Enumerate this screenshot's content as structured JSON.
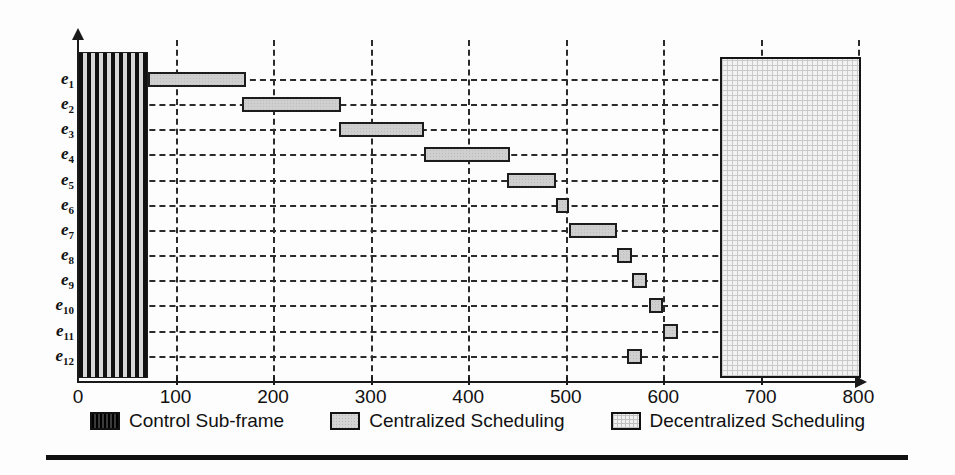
{
  "chart_data": {
    "type": "bar",
    "title": "",
    "subtitle": "",
    "xlabel": "",
    "ylabel": "",
    "orientation": "horizontal",
    "grid": "dashed-both-axes",
    "legend_position": "bottom-center",
    "xlim": [
      0,
      800
    ],
    "xticks": [
      0,
      100,
      200,
      300,
      400,
      500,
      600,
      700,
      800
    ],
    "xtick_labels": [
      "0",
      "100",
      "200",
      "300",
      "400",
      "500",
      "600",
      "700",
      "800"
    ],
    "categories": [
      "e1",
      "e2",
      "e3",
      "e4",
      "e5",
      "e6",
      "e7",
      "e8",
      "e9",
      "e10",
      "e11",
      "e12"
    ],
    "ytick_labels": [
      "e",
      "e",
      "e",
      "e",
      "e",
      "e",
      "e",
      "e",
      "e",
      "e",
      "e",
      "e"
    ],
    "ytick_subscripts": [
      "1",
      "2",
      "3",
      "4",
      "5",
      "6",
      "7",
      "8",
      "9",
      "10",
      "11",
      "12"
    ],
    "series": [
      {
        "name": "Control Sub-frame",
        "kind": "span-block",
        "start": 0,
        "end": 72,
        "spans_all_rows": true,
        "color": "#111111",
        "pattern": "vertical-stripes"
      },
      {
        "name": "Centralized Scheduling",
        "kind": "gantt-bars",
        "color": "#cfcfcf",
        "border": "#1c1c1c",
        "bars": [
          {
            "row": "e1",
            "start": 72,
            "end": 172,
            "duration": 100
          },
          {
            "row": "e2",
            "start": 168,
            "end": 270,
            "duration": 102
          },
          {
            "row": "e3",
            "start": 268,
            "end": 355,
            "duration": 87
          },
          {
            "row": "e4",
            "start": 355,
            "end": 443,
            "duration": 88
          },
          {
            "row": "e5",
            "start": 440,
            "end": 490,
            "duration": 50
          },
          {
            "row": "e6",
            "start": 490,
            "end": 503,
            "duration": 13
          },
          {
            "row": "e7",
            "start": 503,
            "end": 553,
            "duration": 50
          },
          {
            "row": "e8",
            "start": 553,
            "end": 568,
            "duration": 15
          },
          {
            "row": "e9",
            "start": 568,
            "end": 583,
            "duration": 15
          },
          {
            "row": "e10",
            "start": 585,
            "end": 600,
            "duration": 15
          },
          {
            "row": "e11",
            "start": 600,
            "end": 615,
            "duration": 15
          },
          {
            "row": "e12",
            "start": 563,
            "end": 578,
            "duration": 15
          }
        ]
      },
      {
        "name": "Decentralized Scheduling",
        "kind": "span-block",
        "start": 658,
        "end": 803,
        "spans_all_rows": true,
        "color": "#f2f2f2",
        "pattern": "dotted-crosshatch"
      }
    ]
  },
  "legend": {
    "items": [
      {
        "label": "Control Sub-frame",
        "swatch": "control-swatch"
      },
      {
        "label": "Centralized Scheduling",
        "swatch": "centralized-swatch"
      },
      {
        "label": "Decentralized Scheduling",
        "swatch": "decentralized-swatch"
      }
    ]
  },
  "colors": {
    "axis": "#1a1a1a",
    "grid": "#2b2b2b",
    "bar_fill": "#cfcfcf",
    "bar_border": "#1c1c1c",
    "control_fill": "#111111",
    "decentral_fill": "#f2f2f2",
    "background": "#ffffff"
  }
}
